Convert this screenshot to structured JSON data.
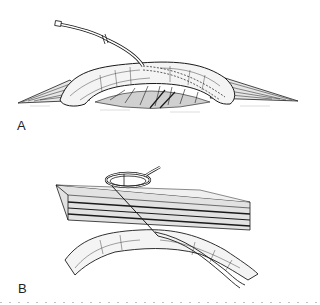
{
  "figure": {
    "panels": [
      {
        "label": "A",
        "description": "Exposed bowel loop lifted in surgical incision with drainage tube inserted; tube path shown by dashed lines inside the lumen",
        "elements": [
          "drainage-tube",
          "bowel-loop",
          "incision-edges",
          "mesentery"
        ]
      },
      {
        "label": "B",
        "description": "Cross-section of abdominal wall layers with coiled tube passing through wall into bowel lumen",
        "elements": [
          "coiled-tube",
          "abdominal-wall-layers",
          "bowel-loop",
          "intraluminal-tube"
        ]
      }
    ]
  },
  "colors": {
    "ink": "#1a1a1a",
    "background": "#ffffff"
  }
}
